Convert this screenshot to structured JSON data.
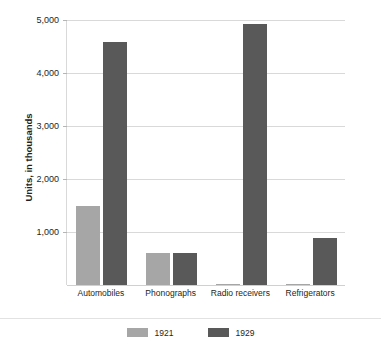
{
  "chart_data": {
    "type": "bar",
    "title": "",
    "xlabel": "",
    "ylabel": "Units, in thousands",
    "ylim": [
      0,
      5000
    ],
    "ytick_labels": [
      "1,000",
      "2,000",
      "3,000",
      "4,000",
      "5,000"
    ],
    "yticks": [
      1000,
      2000,
      3000,
      4000,
      5000
    ],
    "grid": true,
    "legend_position": "bottom",
    "categories": [
      "Automobiles",
      "Phonographs",
      "Radio receivers",
      "Refrigerators"
    ],
    "series": [
      {
        "name": "1921",
        "color": "#a6a6a6",
        "values": [
          1500,
          600,
          20,
          10
        ]
      },
      {
        "name": "1929",
        "color": "#595959",
        "values": [
          4580,
          600,
          4930,
          890
        ]
      }
    ]
  },
  "axis": {
    "y_title": "Units, in thousands"
  },
  "legend": {
    "items": [
      {
        "label": "1921"
      },
      {
        "label": "1929"
      }
    ]
  },
  "colors": {
    "series_1921": "#a6a6a6",
    "series_1929": "#595959",
    "gridline": "#d9d9d9",
    "text": "#231f20",
    "background": "#ffffff"
  }
}
